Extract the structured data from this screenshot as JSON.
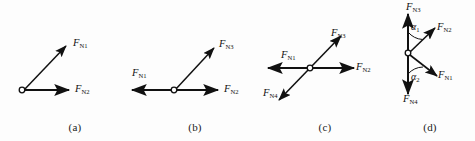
{
  "figure": {
    "background_color": "#fdfdfd",
    "stroke_color": "#111111",
    "origin_marker": "open-circle"
  },
  "panels": [
    {
      "id": "a",
      "caption": "(a)",
      "vectors": [
        {
          "name": "F",
          "sub": "N1",
          "direction": "up-right",
          "label": "F"
        },
        {
          "name": "F",
          "sub": "N2",
          "direction": "right",
          "label": "F"
        }
      ]
    },
    {
      "id": "b",
      "caption": "(b)",
      "vectors": [
        {
          "name": "F",
          "sub": "N1",
          "direction": "left",
          "label": "F"
        },
        {
          "name": "F",
          "sub": "N3",
          "direction": "up-right",
          "label": "F"
        },
        {
          "name": "F",
          "sub": "N2",
          "direction": "right",
          "label": "F"
        }
      ]
    },
    {
      "id": "c",
      "caption": "(c)",
      "vectors": [
        {
          "name": "F",
          "sub": "N3",
          "direction": "up-right",
          "label": "F"
        },
        {
          "name": "F",
          "sub": "N1",
          "direction": "left",
          "label": "F"
        },
        {
          "name": "F",
          "sub": "N2",
          "direction": "right",
          "label": "F"
        },
        {
          "name": "F",
          "sub": "N4",
          "direction": "down-left",
          "label": "F"
        }
      ]
    },
    {
      "id": "d",
      "caption": "(d)",
      "vectors": [
        {
          "name": "F",
          "sub": "N3",
          "direction": "up",
          "label": "F"
        },
        {
          "name": "F",
          "sub": "N2",
          "direction": "up-right",
          "label": "F"
        },
        {
          "name": "F",
          "sub": "N1",
          "direction": "down-right",
          "label": "F"
        },
        {
          "name": "F",
          "sub": "N4",
          "direction": "down",
          "label": "F"
        }
      ],
      "angles": [
        {
          "name": "α",
          "sub": "1",
          "between": "F_N3 and F_N2"
        },
        {
          "name": "α",
          "sub": "2",
          "between": "F_N4 and F_N1"
        }
      ]
    }
  ]
}
